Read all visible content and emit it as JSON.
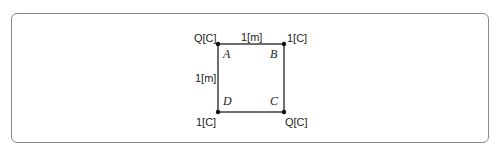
{
  "diagram": {
    "type": "square-charges",
    "points": {
      "A": {
        "label": "A",
        "charge": "Q[C]"
      },
      "B": {
        "label": "B",
        "charge": "1[C]"
      },
      "C": {
        "label": "C",
        "charge": "Q[C]"
      },
      "D": {
        "label": "D",
        "charge": "1[C]"
      }
    },
    "side_top": "1[m]",
    "side_left": "1[m]",
    "colors": {
      "line": "#222222",
      "frame": "#8a8a8a"
    }
  }
}
